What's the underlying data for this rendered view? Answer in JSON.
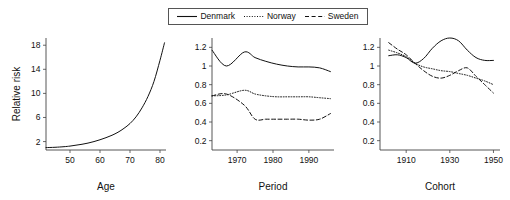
{
  "legend": {
    "position": "top-center",
    "entries": [
      {
        "label": "Denmark",
        "style": "solid",
        "swatch": "line-solid-icon"
      },
      {
        "label": "Norway",
        "style": "dotted",
        "swatch": "line-dotted-icon"
      },
      {
        "label": "Sweden",
        "style": "dashed",
        "swatch": "line-dashed-icon"
      }
    ]
  },
  "chart_data": [
    {
      "type": "line",
      "panel": "age",
      "title": "",
      "xlabel": "Age",
      "ylabel": "Relative risk",
      "xlim": [
        42,
        82
      ],
      "ylim": [
        0.6,
        19.2
      ],
      "xticks": [
        50,
        60,
        70,
        80
      ],
      "yticks": [
        2,
        6,
        10,
        14,
        18
      ],
      "grid": false,
      "series": [
        {
          "name": "Denmark",
          "style": "solid",
          "x": [
            42,
            45,
            48,
            50,
            52,
            54,
            56,
            58,
            60,
            62,
            64,
            66,
            68,
            70,
            72,
            74,
            76,
            78,
            80,
            81.5
          ],
          "values": [
            1.0,
            1.05,
            1.15,
            1.25,
            1.4,
            1.55,
            1.75,
            2.0,
            2.3,
            2.65,
            3.05,
            3.55,
            4.2,
            5.0,
            6.1,
            7.6,
            9.5,
            12.0,
            15.5,
            18.4
          ]
        }
      ]
    },
    {
      "type": "line",
      "panel": "period",
      "title": "",
      "xlabel": "Period",
      "ylabel": "",
      "xlim": [
        1963,
        1997
      ],
      "ylim": [
        0.1,
        1.3
      ],
      "xticks": [
        1970,
        1980,
        1990
      ],
      "yticks": [
        0.2,
        0.4,
        0.6,
        0.8,
        1,
        1.2
      ],
      "grid": false,
      "series": [
        {
          "name": "Denmark",
          "style": "solid",
          "x": [
            1963,
            1967,
            1972,
            1975,
            1978,
            1981,
            1984,
            1987,
            1990,
            1993,
            1996
          ],
          "values": [
            1.17,
            1.0,
            1.15,
            1.09,
            1.05,
            1.02,
            1.0,
            0.99,
            0.99,
            0.98,
            0.94
          ]
        },
        {
          "name": "Norway",
          "style": "dotted",
          "x": [
            1963,
            1967,
            1972,
            1975,
            1978,
            1981,
            1984,
            1987,
            1990,
            1993,
            1996
          ],
          "values": [
            0.68,
            0.69,
            0.74,
            0.7,
            0.68,
            0.67,
            0.67,
            0.67,
            0.67,
            0.66,
            0.65
          ]
        },
        {
          "name": "Sweden",
          "style": "dashed",
          "x": [
            1963,
            1967,
            1972,
            1975,
            1978,
            1981,
            1984,
            1987,
            1990,
            1993,
            1996
          ],
          "values": [
            0.68,
            0.7,
            0.58,
            0.43,
            0.43,
            0.43,
            0.43,
            0.43,
            0.42,
            0.43,
            0.49
          ]
        }
      ]
    },
    {
      "type": "line",
      "panel": "cohort",
      "title": "",
      "xlabel": "Cohort",
      "ylabel": "",
      "xlim": [
        1898,
        1953
      ],
      "ylim": [
        0.1,
        1.3
      ],
      "xticks": [
        1910,
        1930,
        1950
      ],
      "yticks": [
        0.2,
        0.4,
        0.6,
        0.8,
        1,
        1.2
      ],
      "grid": false,
      "series": [
        {
          "name": "Denmark",
          "style": "solid",
          "x": [
            1902,
            1906,
            1910,
            1914,
            1918,
            1922,
            1926,
            1930,
            1934,
            1938,
            1942,
            1946,
            1950
          ],
          "values": [
            1.11,
            1.12,
            1.09,
            1.03,
            1.08,
            1.19,
            1.27,
            1.3,
            1.27,
            1.17,
            1.09,
            1.06,
            1.06
          ]
        },
        {
          "name": "Norway",
          "style": "dotted",
          "x": [
            1902,
            1906,
            1910,
            1914,
            1918,
            1922,
            1926,
            1930,
            1934,
            1938,
            1942,
            1946,
            1950
          ],
          "values": [
            1.17,
            1.14,
            1.1,
            1.03,
            0.99,
            0.97,
            0.95,
            0.94,
            0.92,
            0.9,
            0.87,
            0.84,
            0.8
          ]
        },
        {
          "name": "Sweden",
          "style": "dashed",
          "x": [
            1902,
            1906,
            1910,
            1914,
            1918,
            1922,
            1926,
            1930,
            1934,
            1938,
            1942,
            1946,
            1950
          ],
          "values": [
            1.25,
            1.18,
            1.12,
            1.03,
            0.95,
            0.89,
            0.87,
            0.9,
            0.95,
            0.98,
            0.89,
            0.8,
            0.71
          ]
        }
      ]
    }
  ]
}
